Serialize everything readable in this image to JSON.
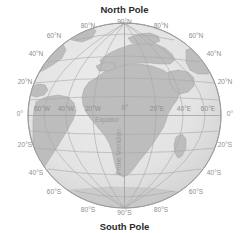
{
  "diagram": {
    "type": "globe-graticule",
    "title_top": "North Pole",
    "title_bottom": "South Pole",
    "projection": "orthographic",
    "center_lon": 0,
    "center_lat": 0,
    "colors": {
      "background": "#ffffff",
      "ocean": "#e3e3e3",
      "land": "#bdbdbd",
      "graticule": "#a8a8a8",
      "outline": "#9b9b9b",
      "label_gray": "#8d8d8d",
      "label_dark": "#2b2b2b"
    },
    "poles": [
      {
        "name": "north-pole",
        "label": "North Pole",
        "x": 124.5,
        "y": 10
      },
      {
        "name": "south-pole",
        "label": "South Pole",
        "x": 124.5,
        "y": 227
      }
    ],
    "latitude_labels_left": [
      {
        "label": "60°N",
        "x": 52,
        "y": 36
      },
      {
        "label": "40°N",
        "x": 35,
        "y": 54
      },
      {
        "label": "20°N",
        "x": 25,
        "y": 82
      },
      {
        "label": "0°",
        "x": 22,
        "y": 113
      },
      {
        "label": "20°S",
        "x": 25,
        "y": 145
      },
      {
        "label": "40°S",
        "x": 35,
        "y": 173
      },
      {
        "label": "60°S",
        "x": 52,
        "y": 192
      }
    ],
    "latitude_labels_right": [
      {
        "label": "60°N",
        "x": 197,
        "y": 36
      },
      {
        "label": "40°N",
        "x": 214,
        "y": 54
      },
      {
        "label": "20°N",
        "x": 224,
        "y": 82
      },
      {
        "label": "0°",
        "x": 227,
        "y": 113
      },
      {
        "label": "20°S",
        "x": 224,
        "y": 145
      },
      {
        "label": "40°S",
        "x": 214,
        "y": 173
      },
      {
        "label": "60°S",
        "x": 197,
        "y": 192
      }
    ],
    "pole_grid_labels": [
      {
        "label": "90°N",
        "x": 124.5,
        "y": 21
      },
      {
        "label": "80°N",
        "x": 88,
        "y": 25
      },
      {
        "label": "80°N",
        "x": 161,
        "y": 25
      },
      {
        "label": "90°S",
        "x": 124.5,
        "y": 212
      },
      {
        "label": "80°S",
        "x": 88,
        "y": 209
      },
      {
        "label": "80°S",
        "x": 161,
        "y": 209
      }
    ],
    "longitude_labels": [
      {
        "label": "60°W",
        "x": 41,
        "y": 110
      },
      {
        "label": "40°W",
        "x": 65,
        "y": 110
      },
      {
        "label": "20°W",
        "x": 92,
        "y": 110
      },
      {
        "label": "0°",
        "x": 125,
        "y": 109
      },
      {
        "label": "20°E",
        "x": 157,
        "y": 110
      },
      {
        "label": "40°E",
        "x": 185,
        "y": 110
      },
      {
        "label": "60°E",
        "x": 208,
        "y": 110
      }
    ],
    "feature_labels": [
      {
        "name": "equator-label",
        "label": "Equator",
        "x": 107,
        "y": 120,
        "rotate": 0
      },
      {
        "name": "prime-meridian-label",
        "label": "Prime Meridian",
        "x": 121,
        "y": 152,
        "rotate": -90
      }
    ],
    "graticule": {
      "latitudes": [
        -80,
        -60,
        -40,
        -20,
        0,
        20,
        40,
        60,
        80
      ],
      "longitudes": [
        -60,
        -40,
        -20,
        0,
        20,
        40,
        60
      ],
      "equator": 0,
      "prime_meridian": 0
    }
  }
}
